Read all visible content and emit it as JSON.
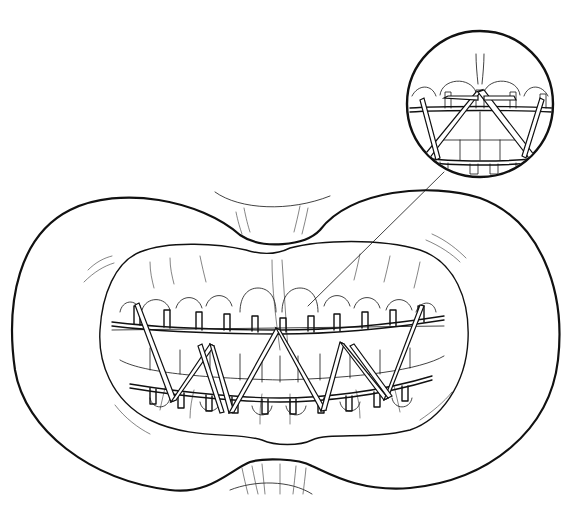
{
  "figure": {
    "has_text_labels": false,
    "inset": {
      "description": "Magnified circular detail of central incisors showing arch bar lugs and elastic bands",
      "center": [
        480,
        104
      ],
      "radius": 73
    },
    "leader_line": {
      "from": [
        444,
        176
      ],
      "to": [
        308,
        306
      ]
    },
    "colors": {
      "ink": "#111111",
      "background": "#ffffff"
    }
  }
}
